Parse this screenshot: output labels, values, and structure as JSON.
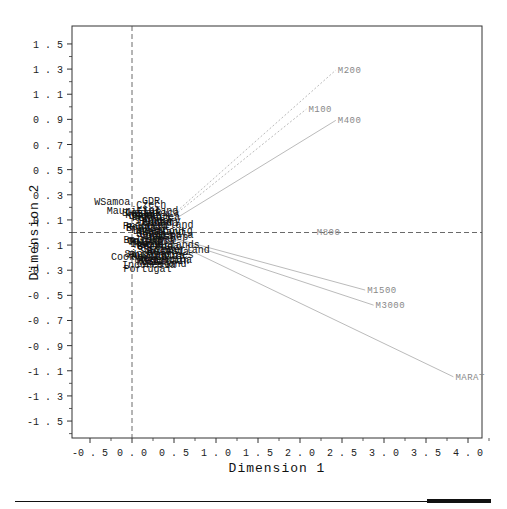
{
  "chart_data": {
    "type": "scatter",
    "subtype": "biplot",
    "title": "",
    "xlabel": "Dimension 1",
    "ylabel": "Dimension 2",
    "xlim": [
      -0.65,
      4.15
    ],
    "ylim": [
      -1.6,
      1.6
    ],
    "grid": false,
    "reference_lines": {
      "x": 0.0,
      "y": 0.0,
      "style": "dashed"
    },
    "x_ticks": [
      "-0.5",
      "0.0",
      "0.5",
      "1.0",
      "1.5",
      "2.0",
      "2.5",
      "3.0",
      "3.5",
      "4.0"
    ],
    "y_ticks": [
      "1.5",
      "1.3",
      "1.1",
      "0.9",
      "0.7",
      "0.5",
      "0.3",
      "0.1",
      "-0.1",
      "-0.3",
      "-0.5",
      "-0.7",
      "-0.9",
      "-1.1",
      "-1.3",
      "-1.5"
    ],
    "vector_origin": [
      0.25,
      0.0
    ],
    "vectors": [
      {
        "label": "M200",
        "x": 2.45,
        "y": 1.3,
        "style": "dotted"
      },
      {
        "label": "M100",
        "x": 2.1,
        "y": 0.99,
        "style": "dotted"
      },
      {
        "label": "M400",
        "x": 2.45,
        "y": 0.9,
        "style": "solid"
      },
      {
        "label": "M800",
        "x": 2.2,
        "y": 0.01,
        "style": "dashed"
      },
      {
        "label": "M1500",
        "x": 2.8,
        "y": -0.45,
        "style": "solid"
      },
      {
        "label": "M3000",
        "x": 2.9,
        "y": -0.57,
        "style": "solid"
      },
      {
        "label": "MARAT",
        "x": 3.85,
        "y": -1.14,
        "style": "solid"
      }
    ],
    "points_visible_labels": [
      {
        "label": "WSamoa",
        "x": -0.45,
        "y": 0.25
      },
      {
        "label": "GDR",
        "x": 0.12,
        "y": 0.26
      },
      {
        "label": "Czech",
        "x": 0.05,
        "y": 0.23
      },
      {
        "label": "Mauritius",
        "x": -0.3,
        "y": 0.18
      },
      {
        "label": "Finland",
        "x": 0.05,
        "y": 0.18
      },
      {
        "label": "Cook",
        "x": -0.25,
        "y": -0.19
      },
      {
        "label": "Norway",
        "x": 0.05,
        "y": -0.23
      },
      {
        "label": "Portugal",
        "x": -0.1,
        "y": -0.28
      }
    ]
  },
  "labels": {
    "xlabel": "Dimension 1",
    "ylabel": "Dimension 2"
  }
}
